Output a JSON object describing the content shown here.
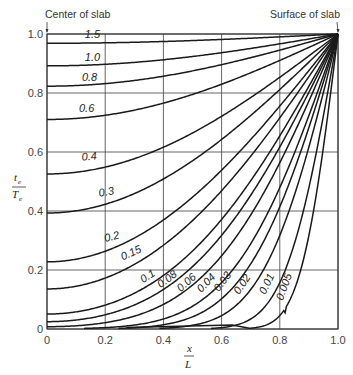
{
  "chart_data": {
    "type": "line",
    "title": "",
    "xlabel": "x/L",
    "ylabel": "t_e/T_e",
    "xlim": [
      0,
      1.0
    ],
    "ylim": [
      0,
      1.0
    ],
    "grid": true,
    "x_ticks": [
      "0",
      "0.2",
      "0.4",
      "0.6",
      "0.8",
      "1.0"
    ],
    "y_ticks": [
      "0",
      "0.2",
      "0.4",
      "0.6",
      "0.8",
      "1.0"
    ],
    "annotations": [
      {
        "text": "Center of slab",
        "x": 0.0,
        "y": 1.0,
        "position": "top-left"
      },
      {
        "text": "Surface of slab",
        "x": 1.0,
        "y": 1.0,
        "position": "top-right"
      }
    ],
    "curve_parameter": "Fourier number (αθ/L²)",
    "x": [
      0,
      0.2,
      0.4,
      0.6,
      0.8,
      1.0
    ],
    "series": [
      {
        "name": "1.5",
        "values": [
          0.97,
          0.97,
          0.98,
          0.99,
          0.99,
          1.0
        ]
      },
      {
        "name": "1.0",
        "values": [
          0.89,
          0.89,
          0.91,
          0.94,
          0.97,
          1.0
        ]
      },
      {
        "name": "0.8",
        "values": [
          0.82,
          0.83,
          0.86,
          0.9,
          0.95,
          1.0
        ]
      },
      {
        "name": "0.6",
        "values": [
          0.7,
          0.72,
          0.76,
          0.83,
          0.91,
          1.0
        ]
      },
      {
        "name": "0.4",
        "values": [
          0.52,
          0.54,
          0.61,
          0.72,
          0.85,
          1.0
        ]
      },
      {
        "name": "0.3",
        "values": [
          0.39,
          0.42,
          0.5,
          0.63,
          0.8,
          1.0
        ]
      },
      {
        "name": "0.2",
        "values": [
          0.23,
          0.26,
          0.35,
          0.51,
          0.73,
          1.0
        ]
      },
      {
        "name": "0.15",
        "values": [
          0.15,
          0.18,
          0.27,
          0.43,
          0.68,
          1.0
        ]
      },
      {
        "name": "0.1",
        "values": [
          0.06,
          0.08,
          0.16,
          0.33,
          0.61,
          1.0
        ]
      },
      {
        "name": "0.08",
        "values": [
          0.03,
          0.05,
          0.11,
          0.28,
          0.57,
          1.0
        ]
      },
      {
        "name": "0.06",
        "values": [
          0.01,
          0.02,
          0.07,
          0.21,
          0.52,
          1.0
        ]
      },
      {
        "name": "0.04",
        "values": [
          0.0,
          0.0,
          0.03,
          0.14,
          0.44,
          1.0
        ]
      },
      {
        "name": "0.03",
        "values": [
          0.0,
          0.0,
          0.01,
          0.1,
          0.41,
          1.0
        ]
      },
      {
        "name": "0.02",
        "values": [
          0.0,
          0.0,
          0.0,
          0.05,
          0.32,
          1.0
        ]
      },
      {
        "name": "0.01",
        "values": [
          0.0,
          0.0,
          0.0,
          0.0,
          0.16,
          1.0
        ]
      },
      {
        "name": "0.005",
        "values": [
          0.0,
          0.0,
          0.0,
          0.0,
          0.05,
          1.0
        ]
      }
    ],
    "curve_params": [
      1.5,
      1.0,
      0.8,
      0.6,
      0.4,
      0.3,
      0.2,
      0.15,
      0.1,
      0.08,
      0.06,
      0.04,
      0.03,
      0.02,
      0.01,
      0.005
    ],
    "curve_labels": [
      {
        "text": "1.5",
        "x": 0.13,
        "y": 0.985,
        "rot": 0
      },
      {
        "text": "1.0",
        "x": 0.13,
        "y": 0.908,
        "rot": 0
      },
      {
        "text": "0.8",
        "x": 0.12,
        "y": 0.842,
        "rot": 0
      },
      {
        "text": "0.6",
        "x": 0.11,
        "y": 0.734,
        "rot": 0
      },
      {
        "text": "0.4",
        "x": 0.12,
        "y": 0.57,
        "rot": -6
      },
      {
        "text": "0.3",
        "x": 0.18,
        "y": 0.448,
        "rot": -10
      },
      {
        "text": "0.2",
        "x": 0.2,
        "y": 0.295,
        "rot": -14
      },
      {
        "text": "0.15",
        "x": 0.26,
        "y": 0.232,
        "rot": -24
      },
      {
        "text": "0.1",
        "x": 0.33,
        "y": 0.155,
        "rot": -32
      },
      {
        "text": "0.08",
        "x": 0.39,
        "y": 0.138,
        "rot": -36
      },
      {
        "text": "0.06",
        "x": 0.46,
        "y": 0.125,
        "rot": -42
      },
      {
        "text": "0.04",
        "x": 0.53,
        "y": 0.122,
        "rot": -46
      },
      {
        "text": "0.03",
        "x": 0.59,
        "y": 0.125,
        "rot": -52
      },
      {
        "text": "0.02",
        "x": 0.66,
        "y": 0.115,
        "rot": -56
      },
      {
        "text": "0.01",
        "x": 0.75,
        "y": 0.115,
        "rot": -64
      },
      {
        "text": "0.005",
        "x": 0.81,
        "y": 0.095,
        "rot": -70
      }
    ]
  },
  "colors": {
    "line": "#1a1a1a",
    "grid": "#555555",
    "text": "#333333",
    "background": "#ffffff"
  }
}
